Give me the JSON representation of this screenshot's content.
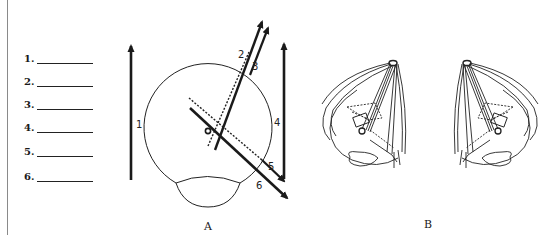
{
  "answer_blanks": [
    {
      "label": "1.",
      "y": 53
    },
    {
      "label": "2.",
      "y": 76
    },
    {
      "label": "3.",
      "y": 99
    },
    {
      "label": "4.",
      "y": 122
    },
    {
      "label": "5.",
      "y": 146
    },
    {
      "label": "6.",
      "y": 171
    }
  ],
  "figure_a": {
    "caption": "A",
    "arrow_labels": [
      "1",
      "2",
      "3",
      "4",
      "5",
      "6"
    ]
  },
  "figure_b": {
    "caption": "B"
  },
  "colors": {
    "ink": "#1a1a1a",
    "rule": "#8a8a8a",
    "background": "#ffffff"
  }
}
